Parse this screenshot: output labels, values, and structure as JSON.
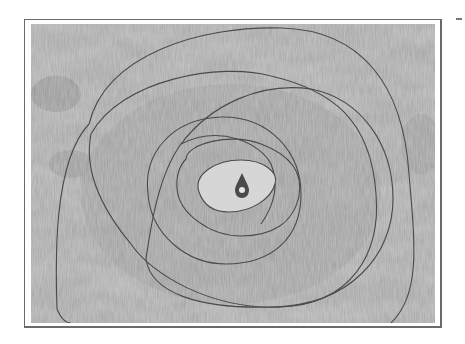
{
  "artwork": {
    "description": "Abstract painting of overlapping concentric rings around a central drop on mottled gray textured canvas",
    "colors": {
      "background": "#ffffff",
      "canvas_base": "#a9a9a9",
      "canvas_light": "#cfcfcf",
      "canvas_dark": "#8a8a8a",
      "line": "#4a4a4a",
      "frame": "#6a6a6a"
    },
    "elements": [
      "outer-ring",
      "second-ring",
      "third-ring",
      "fourth-ring",
      "fifth-ring",
      "inner-eye",
      "center-drop"
    ]
  }
}
